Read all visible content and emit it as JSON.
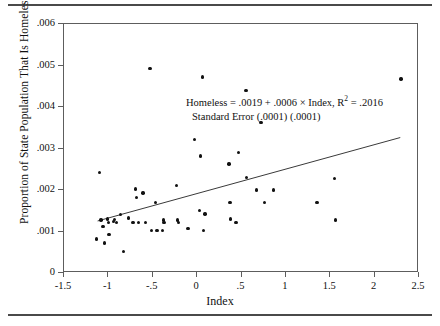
{
  "figure": {
    "top_rule": "horizontal-rule",
    "bottom_rule": "horizontal-rule"
  },
  "annotation": {
    "line1_prefix": "Homeless = .0019 + .0006 ",
    "times": "×",
    "line1_mid": " Index, R",
    "superscript": "2",
    "line1_suffix": " = .2016",
    "line2": "Standard Error   (.0001) (.0001)"
  },
  "chart_data": {
    "type": "scatter",
    "title": "",
    "xlabel": "Index",
    "ylabel": "Proportion of State Population That Is Homeless",
    "xlim": [
      -1.5,
      2.5
    ],
    "ylim": [
      0,
      0.006
    ],
    "grid": false,
    "legend": null,
    "xticks": [
      -1.5,
      -1,
      -0.5,
      0,
      0.5,
      1,
      1.5,
      2,
      2.5
    ],
    "xtick_labels": [
      "-1.5",
      "-1",
      "-.5",
      "0",
      ".5",
      "1",
      "1.5",
      "2",
      "2.5"
    ],
    "yticks": [
      0,
      0.001,
      0.002,
      0.003,
      0.004,
      0.005,
      0.006
    ],
    "ytick_labels": [
      "0",
      ".001",
      ".002",
      ".003",
      ".004",
      ".005",
      ".006"
    ],
    "marker_color": "#111111",
    "line_color": "#3a3a3a",
    "regression": {
      "equation": "Homeless = .0019 + .0006 × Index",
      "intercept": 0.0019,
      "slope": 0.0006,
      "r_squared": 0.2016,
      "standard_errors": [
        0.0001,
        0.0001
      ],
      "x_start": -1.11,
      "x_end": 2.3,
      "y_start": 0.00123,
      "y_end": 0.00324
    },
    "points": [
      {
        "x": -1.09,
        "y": 0.0024
      },
      {
        "x": -1.12,
        "y": 0.0008
      },
      {
        "x": -1.07,
        "y": 0.00125
      },
      {
        "x": -1.05,
        "y": 0.0011
      },
      {
        "x": -1.03,
        "y": 0.0007
      },
      {
        "x": -1.0,
        "y": 0.00128
      },
      {
        "x": -0.99,
        "y": 0.0012
      },
      {
        "x": -0.98,
        "y": 0.0009
      },
      {
        "x": -0.93,
        "y": 0.00122
      },
      {
        "x": -0.92,
        "y": 0.00127
      },
      {
        "x": -0.9,
        "y": 0.0012
      },
      {
        "x": -0.85,
        "y": 0.00138
      },
      {
        "x": -0.82,
        "y": 0.0005
      },
      {
        "x": -0.76,
        "y": 0.0013
      },
      {
        "x": -0.71,
        "y": 0.0012
      },
      {
        "x": -0.68,
        "y": 0.002
      },
      {
        "x": -0.67,
        "y": 0.0018
      },
      {
        "x": -0.65,
        "y": 0.0012
      },
      {
        "x": -0.6,
        "y": 0.0019
      },
      {
        "x": -0.57,
        "y": 0.0012
      },
      {
        "x": -0.52,
        "y": 0.0049
      },
      {
        "x": -0.5,
        "y": 0.001
      },
      {
        "x": -0.46,
        "y": 0.00168
      },
      {
        "x": -0.44,
        "y": 0.001
      },
      {
        "x": -0.38,
        "y": 0.001
      },
      {
        "x": -0.37,
        "y": 0.00125
      },
      {
        "x": -0.36,
        "y": 0.0012
      },
      {
        "x": -0.22,
        "y": 0.00208
      },
      {
        "x": -0.21,
        "y": 0.00125
      },
      {
        "x": -0.2,
        "y": 0.0012
      },
      {
        "x": -0.09,
        "y": 0.00105
      },
      {
        "x": -0.02,
        "y": 0.0032
      },
      {
        "x": 0.04,
        "y": 0.00148
      },
      {
        "x": 0.05,
        "y": 0.0028
      },
      {
        "x": 0.07,
        "y": 0.0047
      },
      {
        "x": 0.08,
        "y": 0.001
      },
      {
        "x": 0.1,
        "y": 0.0014
      },
      {
        "x": 0.37,
        "y": 0.0026
      },
      {
        "x": 0.38,
        "y": 0.00168
      },
      {
        "x": 0.39,
        "y": 0.00128
      },
      {
        "x": 0.45,
        "y": 0.0012
      },
      {
        "x": 0.48,
        "y": 0.00288
      },
      {
        "x": 0.56,
        "y": 0.00438
      },
      {
        "x": 0.57,
        "y": 0.00228
      },
      {
        "x": 0.68,
        "y": 0.00198
      },
      {
        "x": 0.73,
        "y": 0.0036
      },
      {
        "x": 0.77,
        "y": 0.00168
      },
      {
        "x": 0.87,
        "y": 0.00198
      },
      {
        "x": 1.36,
        "y": 0.00168
      },
      {
        "x": 1.56,
        "y": 0.00225
      },
      {
        "x": 1.57,
        "y": 0.00125
      },
      {
        "x": 2.31,
        "y": 0.00465
      }
    ]
  }
}
